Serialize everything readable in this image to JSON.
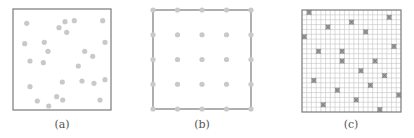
{
  "figure": {
    "colors": {
      "frame": "#7a7a7a",
      "dot": "#c9c9c9",
      "grid": "#c4c4c4",
      "marker": "#8e8e8e"
    },
    "panels": [
      {
        "id": "a",
        "caption": "(a)",
        "description": "random point placement",
        "frame": {
          "x": 13,
          "y": 9,
          "w": 98,
          "h": 101
        },
        "dots": [
          [
            26.7,
            23.3
          ],
          [
            59,
            27.7
          ],
          [
            65,
            21.7
          ],
          [
            74.3,
            20.7
          ],
          [
            102.7,
            20.7
          ],
          [
            66.7,
            32.3
          ],
          [
            24.7,
            43.7
          ],
          [
            44.3,
            42.3
          ],
          [
            105,
            42.3
          ],
          [
            48,
            51.3
          ],
          [
            84.7,
            51.3
          ],
          [
            92.7,
            56.3
          ],
          [
            30,
            61
          ],
          [
            43.3,
            62.7
          ],
          [
            78.3,
            66
          ],
          [
            30,
            86.7
          ],
          [
            62.3,
            82
          ],
          [
            82,
            81
          ],
          [
            94,
            83.3
          ],
          [
            105,
            79.7
          ],
          [
            37.3,
            101
          ],
          [
            56.7,
            96.7
          ],
          [
            62.7,
            100
          ],
          [
            48.7,
            106
          ],
          [
            100,
            100
          ]
        ]
      },
      {
        "id": "b",
        "caption": "(b)",
        "description": "regular 5x5 grid placement",
        "frame": {
          "x": 153,
          "y": 10,
          "w": 98,
          "h": 99
        },
        "grid": {
          "rows": 5,
          "cols": 5
        }
      },
      {
        "id": "c",
        "caption": "(c)",
        "description": "fine grid with randomly selected cells",
        "frame": {
          "x": 302,
          "y": 10,
          "w": 99,
          "h": 102
        },
        "grid": {
          "cells": 21
        },
        "markers": [
          [
            309,
            13
          ],
          [
            389,
            18
          ],
          [
            350,
            23
          ],
          [
            330,
            28
          ],
          [
            364,
            33
          ],
          [
            305,
            38
          ],
          [
            393,
            44
          ],
          [
            344,
            49
          ],
          [
            320,
            53
          ],
          [
            374,
            59
          ],
          [
            340,
            63
          ],
          [
            359,
            69
          ],
          [
            384,
            74
          ],
          [
            315,
            79
          ],
          [
            369,
            84
          ],
          [
            335,
            89
          ],
          [
            398,
            95
          ],
          [
            354,
            99
          ],
          [
            325,
            105
          ],
          [
            379,
            109
          ]
        ]
      }
    ]
  }
}
